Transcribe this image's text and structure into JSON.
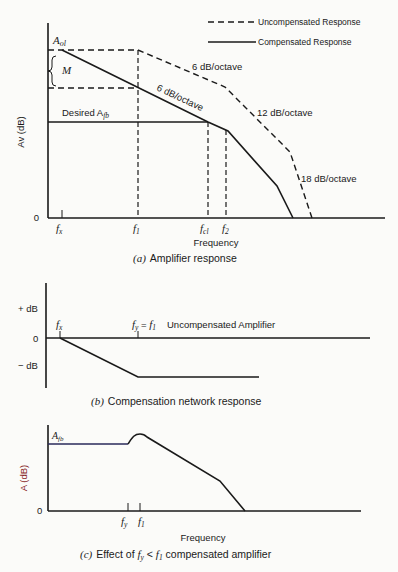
{
  "legend": {
    "uncompensated": "Uncompensated Response",
    "compensated": "Compensated Response"
  },
  "panel_a": {
    "ylabel": "Av (dB)",
    "xlabel": "Frequency",
    "zero": "0",
    "aol_label": "A",
    "aol_sub": "ol",
    "margin_label": "M",
    "desired_label": "Desired A",
    "desired_sub": "fb",
    "slope_uncomp_1": "6 dB/octave",
    "slope_comp_1": "6 dB/octave",
    "slope_uncomp_2": "12 dB/octave",
    "slope_uncomp_3": "18 dB/octave",
    "ticks": {
      "fx": "f",
      "fx_sub": "x",
      "f1": "f",
      "f1_sub": "1",
      "fcl": "f",
      "fcl_sub": "cl",
      "f2": "f",
      "f2_sub": "2"
    },
    "caption_tag": "(a)",
    "caption": "Amplifier response"
  },
  "panel_b": {
    "plus_db": "+ dB",
    "zero": "0",
    "minus_db": "− dB",
    "fx": "f",
    "fx_sub": "x",
    "fy_label": "f",
    "fy_sub": "y",
    "eq": " = ",
    "f1": "f",
    "f1_sub": "1",
    "annotation": "Uncompensated Amplifier",
    "caption_tag": "(b)",
    "caption": "Compensation network response"
  },
  "panel_c": {
    "ylabel": "A (dB)",
    "zero": "0",
    "afb": "A",
    "afb_sub": "fb",
    "fy": "f",
    "fy_sub": "y",
    "f1": "f",
    "f1_sub": "1",
    "xlabel": "Frequency",
    "caption_tag": "(c)",
    "caption_pre": "Effect of ",
    "caption_math": "f",
    "caption_math_sub": "y",
    "caption_lt": " < ",
    "caption_math2": "f",
    "caption_math2_sub": "1",
    "caption_post": " compensated amplifier"
  }
}
